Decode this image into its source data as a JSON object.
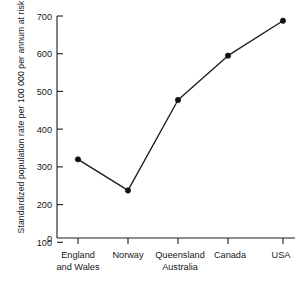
{
  "chart_data": {
    "type": "line",
    "title": "",
    "xlabel": "",
    "ylabel": "Standardized population rate per 100 000 per annum at risk",
    "categories": [
      "England and Wales",
      "Norway",
      "Queensland Australia",
      "Canada",
      "USA"
    ],
    "category_lines": [
      [
        "England",
        "and Wales"
      ],
      [
        "Norway"
      ],
      [
        "Queensland",
        "Australia"
      ],
      [
        "Canada"
      ],
      [
        "USA"
      ]
    ],
    "values": [
      248,
      150,
      435,
      575,
      685
    ],
    "ylim": [
      0,
      700
    ],
    "ytick_labels": [
      "0",
      "100",
      "200",
      "300",
      "400",
      "500",
      "600",
      "700"
    ],
    "ytick_values": [
      0,
      100,
      200,
      300,
      400,
      500,
      600,
      700
    ],
    "grid": false,
    "legend": null,
    "marker": "filled-circle",
    "line_color": "#1d1d1d",
    "marker_color": "#111111",
    "background_color": "#ffffff"
  }
}
